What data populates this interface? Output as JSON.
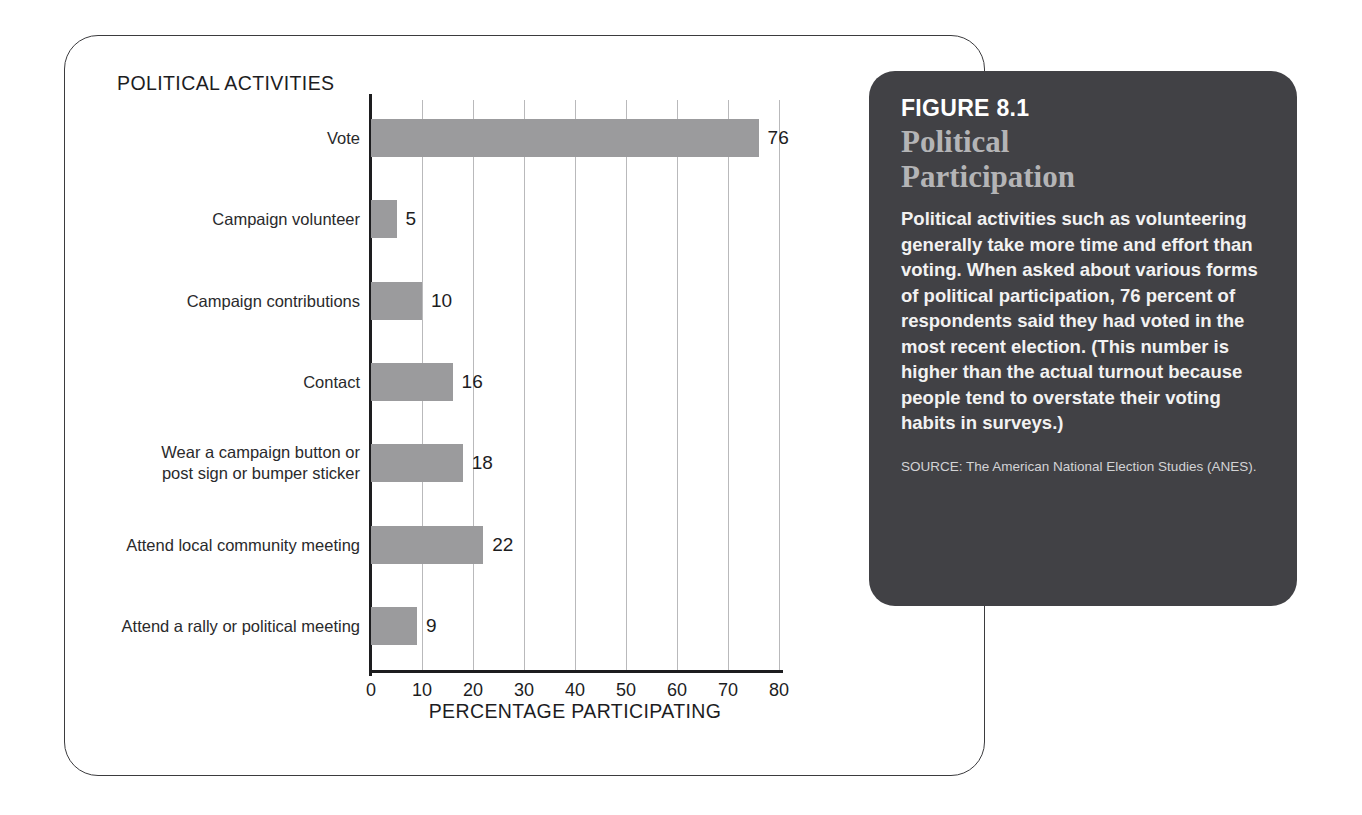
{
  "chart_card": {
    "title": "POLITICAL ACTIVITIES"
  },
  "chart_data": {
    "type": "bar",
    "orientation": "horizontal",
    "title": "POLITICAL ACTIVITIES",
    "xlabel": "PERCENTAGE PARTICIPATING",
    "ylabel": "",
    "xlim": [
      0,
      80
    ],
    "xticks": [
      0,
      10,
      20,
      30,
      40,
      50,
      60,
      70,
      80
    ],
    "grid": "vertical",
    "legend": "none",
    "bar_color": "#9b9b9d",
    "categories": [
      "Vote",
      "Campaign volunteer",
      "Campaign contributions",
      "Contact",
      "Wear a campaign button or\npost sign or bumper sticker",
      "Attend local community meeting",
      "Attend a rally or political meeting"
    ],
    "values": [
      76,
      5,
      10,
      16,
      18,
      22,
      9
    ],
    "value_labels": [
      "76",
      "5",
      "10",
      "16",
      "18",
      "22",
      "9"
    ]
  },
  "caption": {
    "figure_number": "FIGURE 8.1",
    "figure_title": "Political\nParticipation",
    "body": "Political activities such as volunteering generally take more time and effort than voting. When asked about various forms of political participation, 76 percent of respondents said they had voted in the most recent election. (This number is higher than the actual turnout because people tend to overstate their voting habits in surveys.)",
    "source": "SOURCE: The American National Election Studies (ANES).",
    "background_color": "#414145",
    "title_color": "#b4b4b6"
  }
}
